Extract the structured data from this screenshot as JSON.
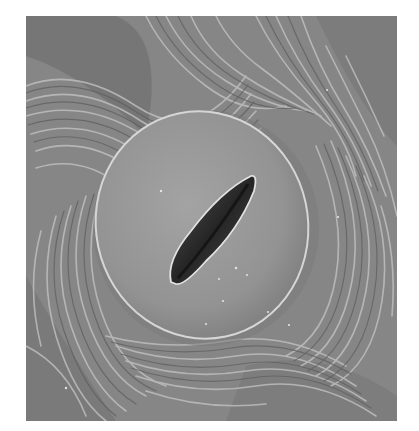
{
  "image": {
    "subject": "stoma",
    "description": "Scanning electron micrograph of a plant leaf stoma: an oval pair of guard cells with a diagonal slit-shaped pore, surrounded by wrinkled, striated epidermal cuticle.",
    "palette": {
      "background": "#ffffff",
      "epidermis_base": "#8a8a8a",
      "ridge_light": "#c4c4c4",
      "ridge_dark": "#5e5e5e",
      "guard_cell": "#9a9a9a",
      "guard_cell_rim": "#d8d8d8",
      "pore_dark": "#2e2e2e"
    }
  }
}
